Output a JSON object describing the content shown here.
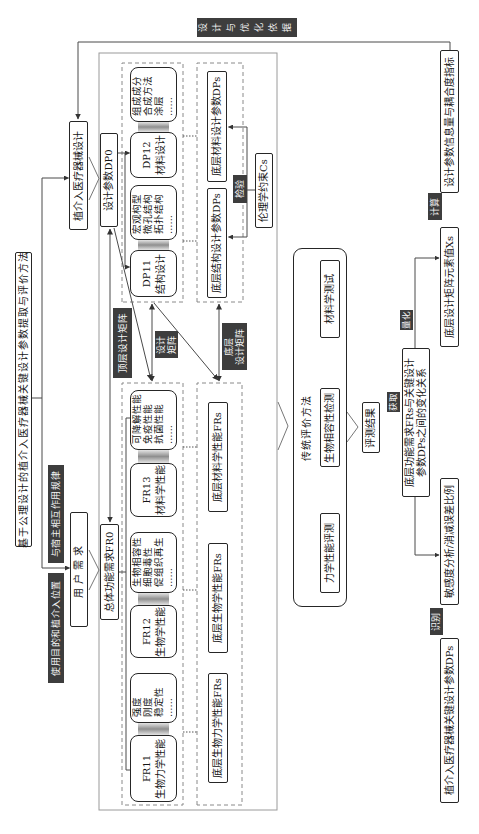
{
  "title": "基于公理设计的植介入医疗器械关键设计参数提取与评价方法",
  "feedback_tag": "设计与优化依据",
  "inputs": {
    "device_design": "植介入医疗器械设计",
    "user_needs": "用户需求",
    "host_interaction_tag": "与宿主相互作用规律",
    "purpose_location_tag": "使用目的和植介入位置"
  },
  "top_level": {
    "fr0": "总体功能需求FR0",
    "dp0": "设计参数DP0"
  },
  "matrix_tags": {
    "top": "顶层设计矩阵",
    "design": [
      "设计",
      "矩阵"
    ],
    "bottom": [
      "底层",
      "设计矩阵"
    ]
  },
  "functional_requirements": [
    {
      "id": "FR11",
      "name": "生物力学性能",
      "details": [
        "强度",
        "刚度",
        "稳定性",
        "……"
      ]
    },
    {
      "id": "FR12",
      "name": "生物学性能",
      "details": [
        "生物相容性",
        "细胞毒性",
        "促组织再生",
        "……"
      ]
    },
    {
      "id": "FR13",
      "name": "材料学性能",
      "details": [
        "可降解性能",
        "免疫性能",
        "抗菌性能",
        "……"
      ]
    }
  ],
  "design_parameters": [
    {
      "id": "DP11",
      "name": "结构设计",
      "details": [
        "宏观构型",
        "微孔结构",
        "拓扑结构",
        "……"
      ]
    },
    {
      "id": "DP12",
      "name": "材料设计",
      "details": [
        "组成成分",
        "合成方法",
        "涂层",
        "……"
      ]
    }
  ],
  "bottom_frs": [
    "底层生物力学性能FRs",
    "底层生物学性能FRs",
    "底层材料学性能FRs"
  ],
  "bottom_dps": [
    "底层结构设计参数DPs",
    "底层材料设计参数DPs"
  ],
  "constraint": {
    "tag": "检验",
    "label": "伦理学约束Cs"
  },
  "evaluation": {
    "title": "传统评价方法",
    "tests": [
      "力学性能评测",
      "生物相容性检测",
      "材料学测试"
    ],
    "result": "评测结果"
  },
  "analysis": {
    "acquire_tag": "获取",
    "relation": [
      "底层功能需求FRs与关键设计",
      "参数DPs之间的变化关系"
    ],
    "quantify_tag": "量化",
    "matrix_values": "底层设计矩阵元素值Xs",
    "compute_tag": "计算",
    "info_metrics": "设计参数信息量与耦合度指标",
    "sensitivity": "敏感度分析/消减误差比例",
    "identify_tag": "识别",
    "key_dps": "植介入医疗器械关键设计参数DPs"
  },
  "colors": {
    "tag_bg": "#3d3d3d",
    "line": "#4a4a4a",
    "frame": "#9a9a9a"
  }
}
